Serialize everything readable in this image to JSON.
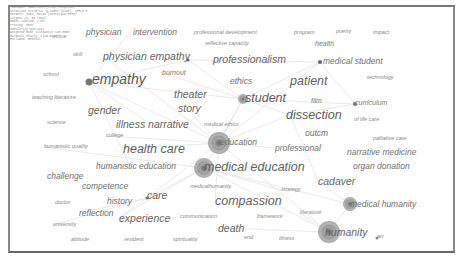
{
  "info_box": {
    "lines": [
      "Timespan: 1998-2021 (Slice Length=1)",
      "Selection Criteria: g-index (k=25), LRF=3.0",
      "Network: N=94, E=231 (Density=0.0528)",
      "Largest CC: 89 (94%)",
      "Nodes Labeled: 1.0%",
      "Pruning: None",
      "Modularity Q=0.4712",
      "Weighted Mean Silhouette S=0.8053",
      "Harmonic Mean(Q, S)=0.5947",
      "Excluded: medical"
    ]
  },
  "keywords": [
    {
      "label": "virtue",
      "x": 53,
      "y": 37,
      "size": 1
    },
    {
      "label": "physician",
      "x": 86,
      "y": 32,
      "size": 3
    },
    {
      "label": "intervention",
      "x": 133,
      "y": 32,
      "size": 3
    },
    {
      "label": "professional development",
      "x": 194,
      "y": 33,
      "size": 1
    },
    {
      "label": "program",
      "x": 294,
      "y": 33,
      "size": 1
    },
    {
      "label": "poetry",
      "x": 336,
      "y": 32,
      "size": 1
    },
    {
      "label": "impact",
      "x": 373,
      "y": 33,
      "size": 1
    },
    {
      "label": "reflective capacity",
      "x": 205,
      "y": 44,
      "size": 1
    },
    {
      "label": "health",
      "x": 315,
      "y": 43,
      "size": 2
    },
    {
      "label": "skill",
      "x": 73,
      "y": 55,
      "size": 1
    },
    {
      "label": "physician empathy",
      "x": 103,
      "y": 56,
      "size": 4
    },
    {
      "label": "professionalism",
      "x": 213,
      "y": 59,
      "size": 4
    },
    {
      "label": "medical student",
      "x": 323,
      "y": 61,
      "size": 3
    },
    {
      "label": "school",
      "x": 43,
      "y": 75,
      "size": 1
    },
    {
      "label": "empathy",
      "x": 92,
      "y": 79,
      "size": 6
    },
    {
      "label": "burnout",
      "x": 162,
      "y": 72,
      "size": 2
    },
    {
      "label": "ethics",
      "x": 230,
      "y": 81,
      "size": 3
    },
    {
      "label": "patient",
      "x": 290,
      "y": 81,
      "size": 5
    },
    {
      "label": "technology",
      "x": 367,
      "y": 78,
      "size": 1
    },
    {
      "label": "teaching literature",
      "x": 32,
      "y": 98,
      "size": 1
    },
    {
      "label": "theater",
      "x": 174,
      "y": 94,
      "size": 4
    },
    {
      "label": "student",
      "x": 245,
      "y": 98,
      "size": 5
    },
    {
      "label": "film",
      "x": 311,
      "y": 100,
      "size": 2
    },
    {
      "label": "curriculum",
      "x": 355,
      "y": 102,
      "size": 2
    },
    {
      "label": "gender",
      "x": 88,
      "y": 110,
      "size": 4
    },
    {
      "label": "story",
      "x": 178,
      "y": 108,
      "size": 4
    },
    {
      "label": "dissection",
      "x": 286,
      "y": 115,
      "size": 5
    },
    {
      "label": "of life care",
      "x": 354,
      "y": 120,
      "size": 1
    },
    {
      "label": "science",
      "x": 47,
      "y": 123,
      "size": 1
    },
    {
      "label": "illness narrative",
      "x": 116,
      "y": 124,
      "size": 4
    },
    {
      "label": "medical ethics",
      "x": 204,
      "y": 125,
      "size": 1
    },
    {
      "label": "college",
      "x": 106,
      "y": 136,
      "size": 1
    },
    {
      "label": "outcm",
      "x": 305,
      "y": 133,
      "size": 3
    },
    {
      "label": "palliative care",
      "x": 373,
      "y": 139,
      "size": 1
    },
    {
      "label": "humanistic quality",
      "x": 44,
      "y": 147,
      "size": 1
    },
    {
      "label": "health care",
      "x": 123,
      "y": 149,
      "size": 5
    },
    {
      "label": "education",
      "x": 220,
      "y": 142,
      "size": 3
    },
    {
      "label": "professional",
      "x": 275,
      "y": 148,
      "size": 3
    },
    {
      "label": "narrative medicine",
      "x": 347,
      "y": 152,
      "size": 3
    },
    {
      "label": "humanistic education",
      "x": 96,
      "y": 166,
      "size": 3
    },
    {
      "label": "medical education",
      "x": 204,
      "y": 167,
      "size": 5
    },
    {
      "label": "organ donation",
      "x": 353,
      "y": 166,
      "size": 3
    },
    {
      "label": "challenge",
      "x": 47,
      "y": 176,
      "size": 3
    },
    {
      "label": "cadaver",
      "x": 318,
      "y": 181,
      "size": 4
    },
    {
      "label": "competence",
      "x": 82,
      "y": 186,
      "size": 3
    },
    {
      "label": "medicalhumanity",
      "x": 190,
      "y": 187,
      "size": 1
    },
    {
      "label": "strategy",
      "x": 281,
      "y": 190,
      "size": 1
    },
    {
      "label": "care",
      "x": 147,
      "y": 195,
      "size": 4
    },
    {
      "label": "compassion",
      "x": 215,
      "y": 201,
      "size": 5
    },
    {
      "label": "doctor",
      "x": 55,
      "y": 203,
      "size": 1
    },
    {
      "label": "history",
      "x": 107,
      "y": 201,
      "size": 3
    },
    {
      "label": "medical humanity",
      "x": 350,
      "y": 204,
      "size": 3
    },
    {
      "label": "reflection",
      "x": 79,
      "y": 213,
      "size": 3
    },
    {
      "label": "experience",
      "x": 119,
      "y": 218,
      "size": 4
    },
    {
      "label": "communication",
      "x": 180,
      "y": 217,
      "size": 1
    },
    {
      "label": "framework",
      "x": 257,
      "y": 217,
      "size": 1
    },
    {
      "label": "literature",
      "x": 300,
      "y": 213,
      "size": 1
    },
    {
      "label": "university",
      "x": 53,
      "y": 225,
      "size": 1
    },
    {
      "label": "death",
      "x": 218,
      "y": 228,
      "size": 4
    },
    {
      "label": "humanity",
      "x": 325,
      "y": 232,
      "size": 4
    },
    {
      "label": "art",
      "x": 377,
      "y": 237,
      "size": 1
    },
    {
      "label": "attitude",
      "x": 71,
      "y": 240,
      "size": 1
    },
    {
      "label": "resident",
      "x": 124,
      "y": 240,
      "size": 1
    },
    {
      "label": "spirituality",
      "x": 173,
      "y": 240,
      "size": 1
    },
    {
      "label": "end",
      "x": 244,
      "y": 238,
      "size": 1
    },
    {
      "label": "illness",
      "x": 279,
      "y": 239,
      "size": 1
    }
  ],
  "nodes": [
    {
      "name": "education",
      "x": 219,
      "y": 143,
      "r": 11,
      "color": "#8a8a8a"
    },
    {
      "name": "medical education",
      "x": 204,
      "y": 168,
      "r": 10,
      "color": "#8e8e8e"
    },
    {
      "name": "humanity",
      "x": 329,
      "y": 232,
      "r": 11,
      "color": "#909090"
    },
    {
      "name": "medical humanity",
      "x": 350,
      "y": 204,
      "r": 7,
      "color": "#9a9a9a"
    },
    {
      "name": "student",
      "x": 243,
      "y": 99,
      "r": 5,
      "color": "#8c8c8c"
    },
    {
      "name": "empathy",
      "x": 89,
      "y": 82,
      "r": 3.5,
      "color": "#777"
    },
    {
      "name": "professionalism",
      "x": 188,
      "y": 60,
      "r": 1.5,
      "color": "#666"
    },
    {
      "name": "medical student",
      "x": 320,
      "y": 62,
      "r": 2,
      "color": "#666"
    },
    {
      "name": "curriculum",
      "x": 355,
      "y": 104,
      "r": 2,
      "color": "#777"
    },
    {
      "name": "care",
      "x": 147,
      "y": 198,
      "r": 1.5,
      "color": "#777"
    },
    {
      "name": "art",
      "x": 377,
      "y": 238,
      "r": 1.5,
      "color": "#888"
    }
  ],
  "links": [
    [
      89,
      82,
      219,
      143
    ],
    [
      89,
      82,
      188,
      60
    ],
    [
      89,
      82,
      243,
      99
    ],
    [
      89,
      82,
      130,
      166
    ],
    [
      89,
      82,
      150,
      124
    ],
    [
      219,
      143,
      329,
      232
    ],
    [
      219,
      143,
      243,
      99
    ],
    [
      219,
      143,
      320,
      62
    ],
    [
      219,
      143,
      290,
      115
    ],
    [
      219,
      143,
      147,
      198
    ],
    [
      204,
      168,
      329,
      232
    ],
    [
      204,
      168,
      350,
      204
    ],
    [
      204,
      168,
      147,
      198
    ],
    [
      204,
      168,
      119,
      218
    ],
    [
      204,
      168,
      243,
      99
    ],
    [
      243,
      99,
      320,
      62
    ],
    [
      243,
      99,
      355,
      104
    ],
    [
      243,
      99,
      290,
      115
    ],
    [
      188,
      60,
      243,
      99
    ],
    [
      188,
      60,
      320,
      62
    ],
    [
      329,
      232,
      350,
      204
    ],
    [
      329,
      232,
      218,
      228
    ],
    [
      329,
      232,
      300,
      213
    ],
    [
      350,
      204,
      318,
      181
    ],
    [
      290,
      115,
      318,
      181
    ],
    [
      130,
      32,
      89,
      82
    ],
    [
      103,
      56,
      219,
      143
    ],
    [
      147,
      198,
      79,
      213
    ],
    [
      147,
      198,
      119,
      218
    ],
    [
      219,
      143,
      123,
      149
    ],
    [
      219,
      143,
      215,
      201
    ],
    [
      106,
      136,
      219,
      143
    ],
    [
      44,
      147,
      204,
      168
    ],
    [
      290,
      115,
      355,
      104
    ],
    [
      320,
      62,
      355,
      104
    ],
    [
      204,
      168,
      281,
      190
    ],
    [
      219,
      143,
      275,
      148
    ],
    [
      160,
      72,
      243,
      99
    ],
    [
      174,
      94,
      219,
      143
    ],
    [
      53,
      225,
      147,
      198
    ]
  ]
}
